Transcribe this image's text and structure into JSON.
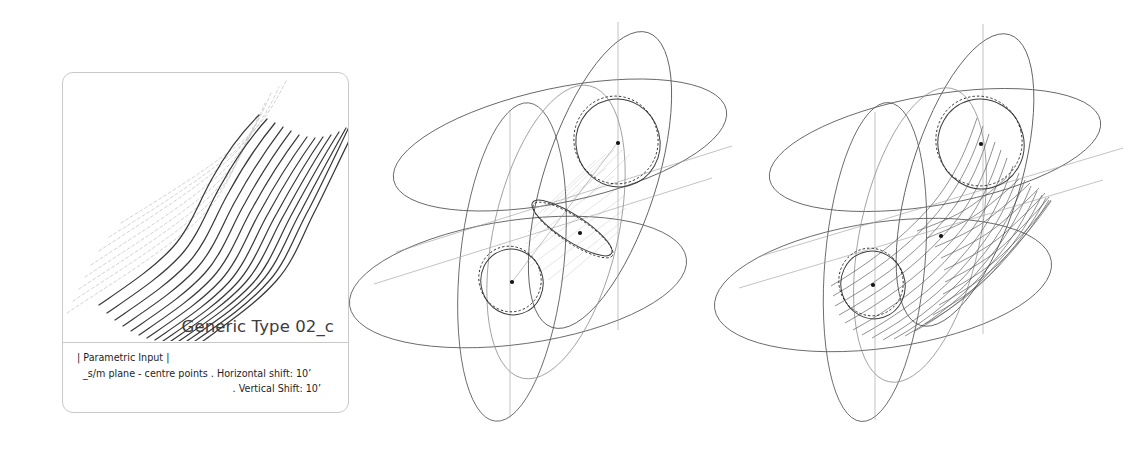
{
  "sheet": {
    "background_color": "#ffffff",
    "ink_color": "#3c3c3c",
    "guide_color": "#c9c9c9"
  },
  "card": {
    "title": "Generic Type 02_c",
    "border_color": "#c9c9c9",
    "meta": {
      "heading": "| Parametric Input |",
      "line_plane": "_s/m plane - centre points . Horizontal shift: 10’",
      "line_vertical": ". Vertical Shift: 10’"
    },
    "parameters": [
      {
        "name": "plane",
        "value": "_s/m plane - centre points"
      },
      {
        "name": "Horizontal shift",
        "value": "10’"
      },
      {
        "name": "Vertical Shift",
        "value": "10’"
      }
    ]
  },
  "figures": [
    {
      "id": "thumbnail-curve-family",
      "label": "generic type 02_c curve family",
      "type": "curve-family",
      "curve_count": 14,
      "ghost_curve_count": 8,
      "description": "family of S-shaped swept curves with faint dashed construction trails"
    },
    {
      "id": "construction-middle",
      "label": "construction study - centre points",
      "type": "axonometric-construction",
      "ellipse_count": 5,
      "circle_count": 3,
      "centre_point_count": 3,
      "hatched": true,
      "description": "three intersecting great-ellipse planes with two full circles and one edge-on circle, faint hatched connecting surface"
    },
    {
      "id": "construction-right",
      "label": "construction study - ruled surface",
      "type": "axonometric-construction",
      "ellipse_count": 5,
      "circle_count": 2,
      "centre_point_count": 3,
      "rule_line_count": 22,
      "hatched": false,
      "description": "same ellipse framework resolved into a ruled tubular surface generated between the two circles"
    }
  ]
}
